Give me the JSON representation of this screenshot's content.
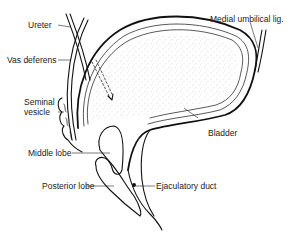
{
  "figure": {
    "labels": {
      "ureter": "Ureter",
      "vas_deferens": "Vas deferens",
      "seminal_vesicle_line1": "Seminal",
      "seminal_vesicle_line2": "vesicle",
      "middle_lobe": "Middle lobe",
      "posterior_lobe": "Posterior lobe",
      "medial_umbilical_lig": "Medial umbilical lig.",
      "bladder": "Bladder",
      "ejaculatory_duct": "Ejaculatory duct"
    },
    "colors": {
      "ink": "#111111",
      "background": "#ffffff",
      "stipple": "#555555"
    }
  }
}
